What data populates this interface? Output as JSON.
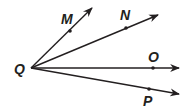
{
  "diagram": {
    "vertex": {
      "label": "Q"
    },
    "rays": [
      {
        "point_label": "M"
      },
      {
        "point_label": "N"
      },
      {
        "point_label": "O"
      },
      {
        "point_label": "P"
      }
    ]
  }
}
